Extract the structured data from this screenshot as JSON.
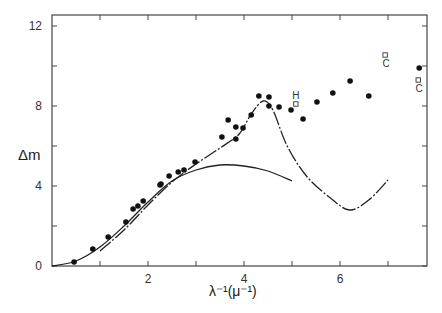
{
  "chart_data": {
    "type": "scatter",
    "title": "",
    "xlabel": "λ⁻¹(μ⁻¹)",
    "ylabel": "Δm",
    "xlim": [
      0,
      7.8
    ],
    "ylim": [
      0,
      12.5
    ],
    "x_ticks": [
      1,
      2,
      3,
      4,
      5,
      6,
      7
    ],
    "x_tick_labels": [
      "",
      "2",
      "",
      "4",
      "",
      "6",
      ""
    ],
    "y_ticks": [
      0,
      2,
      4,
      6,
      8,
      10,
      12
    ],
    "y_tick_labels": [
      "0",
      "",
      "4",
      "",
      "8",
      "",
      "12"
    ],
    "grid": false,
    "legend": null,
    "series": [
      {
        "name": "observed",
        "marker": "filled-circle",
        "points": [
          [
            0.46,
            0.2
          ],
          [
            0.85,
            0.85
          ],
          [
            1.17,
            1.45
          ],
          [
            1.54,
            2.2
          ],
          [
            1.69,
            2.85
          ],
          [
            1.79,
            3.0
          ],
          [
            1.9,
            3.25
          ],
          [
            2.25,
            4.05
          ],
          [
            2.27,
            4.1
          ],
          [
            2.44,
            4.5
          ],
          [
            2.63,
            4.7
          ],
          [
            2.75,
            4.8
          ],
          [
            2.98,
            5.2
          ],
          [
            3.54,
            6.45
          ],
          [
            3.67,
            7.3
          ],
          [
            3.83,
            6.95
          ],
          [
            3.83,
            6.35
          ],
          [
            3.98,
            6.9
          ],
          [
            4.15,
            7.55
          ],
          [
            4.31,
            8.5
          ],
          [
            4.52,
            8.45
          ],
          [
            4.52,
            8.0
          ],
          [
            4.73,
            7.95
          ],
          [
            4.98,
            7.8
          ],
          [
            5.23,
            7.35
          ],
          [
            5.52,
            8.2
          ],
          [
            5.85,
            8.65
          ],
          [
            6.21,
            9.25
          ],
          [
            6.6,
            8.5
          ],
          [
            7.65,
            9.9
          ]
        ]
      },
      {
        "name": "labeled",
        "marker": "open-square",
        "points": [
          {
            "x": 5.08,
            "y": 8.1,
            "label": "H"
          },
          {
            "x": 6.94,
            "y": 10.55,
            "label": "C"
          },
          {
            "x": 7.63,
            "y": 9.3,
            "label": "C"
          }
        ]
      },
      {
        "name": "model-solid",
        "line": "solid",
        "points": [
          [
            0,
            0
          ],
          [
            0.5,
            0.25
          ],
          [
            1.0,
            0.95
          ],
          [
            1.5,
            2.0
          ],
          [
            2.0,
            3.2
          ],
          [
            2.5,
            4.25
          ],
          [
            3.0,
            4.8
          ],
          [
            3.5,
            5.05
          ],
          [
            4.0,
            5.0
          ],
          [
            4.5,
            4.75
          ],
          [
            5.0,
            4.25
          ]
        ]
      },
      {
        "name": "model-dashdot",
        "line": "dash-dot",
        "points": [
          [
            1.0,
            0.75
          ],
          [
            1.5,
            1.8
          ],
          [
            2.0,
            3.05
          ],
          [
            2.5,
            4.2
          ],
          [
            3.0,
            5.1
          ],
          [
            3.5,
            5.9
          ],
          [
            3.9,
            6.6
          ],
          [
            4.15,
            7.6
          ],
          [
            4.4,
            8.25
          ],
          [
            4.6,
            7.8
          ],
          [
            4.9,
            6.0
          ],
          [
            5.3,
            4.5
          ],
          [
            5.8,
            3.4
          ],
          [
            6.2,
            2.8
          ],
          [
            6.6,
            3.3
          ],
          [
            7.0,
            4.3
          ]
        ]
      }
    ]
  },
  "axes": {
    "xlabel": "λ⁻¹(μ⁻¹)",
    "ylabel": "Δm",
    "x_tick_text": [
      "2",
      "4",
      "6"
    ],
    "y_tick_text": [
      "0",
      "4",
      "8",
      "12"
    ]
  }
}
